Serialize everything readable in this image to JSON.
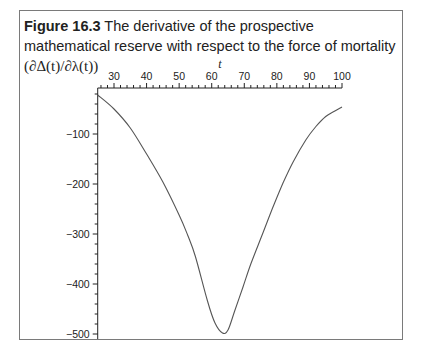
{
  "figure": {
    "label": "Figure 16.3",
    "caption_text": " The derivative of the prospective mathematical reserve with respect to the force of mortality ",
    "caption_math": "(∂Δ(t)/∂λ(t))"
  },
  "chart_data": {
    "type": "line",
    "title": "Figure 16.3 The derivative of the prospective mathematical reserve with respect to the force of mortality (∂Δ(t)/∂λ(t))",
    "xlabel": "t",
    "ylabel": "",
    "xlim": [
      25,
      100
    ],
    "ylim": [
      -510,
      0
    ],
    "x_ticks": [
      30,
      40,
      50,
      60,
      70,
      80,
      90,
      100
    ],
    "y_ticks": [
      -100,
      -200,
      -300,
      -400,
      -500
    ],
    "x_axis_position": "top",
    "grid": false,
    "legend": null,
    "series": [
      {
        "name": "∂Δ(t)/∂λ(t)",
        "color": "#555555",
        "x": [
          25,
          30,
          35,
          40,
          45,
          50,
          52.6,
          55,
          58.7,
          61,
          63.3,
          65,
          67,
          69.6,
          72,
          75.7,
          79,
          81.9,
          85,
          88.9,
          92,
          95,
          97.5,
          100
        ],
        "y": [
          -22,
          -50,
          -88,
          -140,
          -196,
          -262,
          -302,
          -345,
          -434,
          -478,
          -498,
          -492,
          -455,
          -406,
          -360,
          -298,
          -243,
          -198,
          -156,
          -112,
          -85,
          -65,
          -55,
          -46
        ]
      }
    ]
  }
}
